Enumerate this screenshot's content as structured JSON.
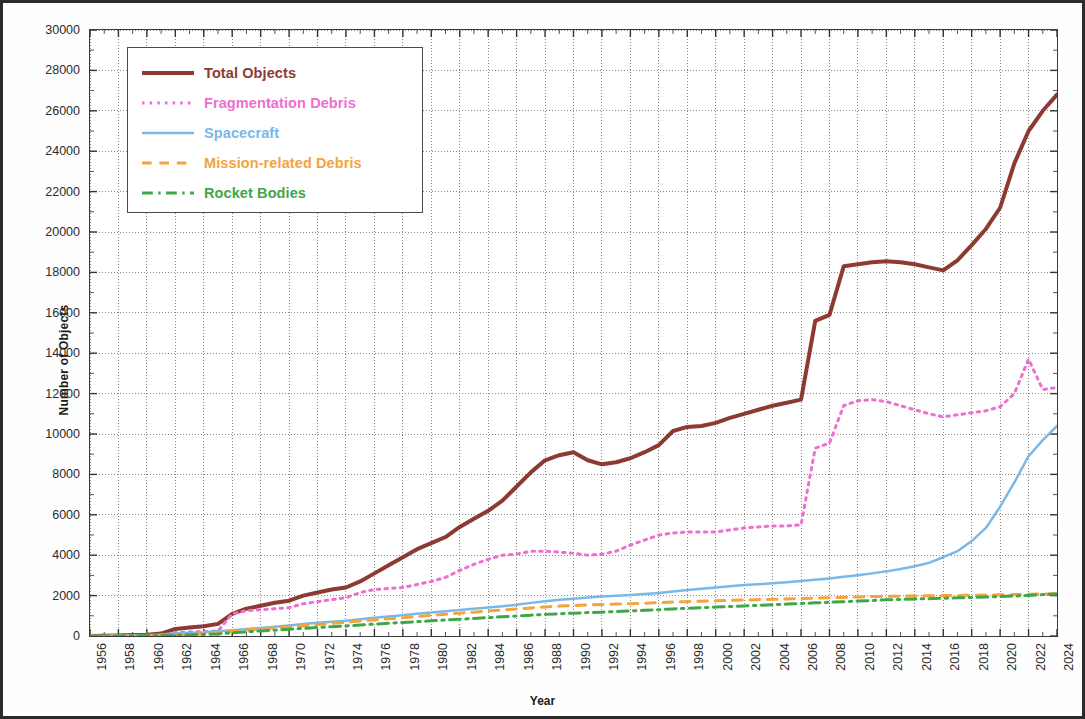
{
  "chart_data": {
    "type": "line",
    "title": "",
    "xlabel": "Year",
    "ylabel": "Number of Objects",
    "xlim": [
      1956,
      2024
    ],
    "ylim": [
      0,
      30000
    ],
    "ytick_step": 2000,
    "xtick_step": 2,
    "grid": true,
    "legend_position": "upper-left",
    "xticks": [
      "1956",
      "1958",
      "1960",
      "1962",
      "1964",
      "1966",
      "1968",
      "1970",
      "1972",
      "1974",
      "1976",
      "1978",
      "1980",
      "1982",
      "1984",
      "1986",
      "1988",
      "1990",
      "1992",
      "1994",
      "1996",
      "1998",
      "2000",
      "2002",
      "2004",
      "2006",
      "2008",
      "2010",
      "2012",
      "2014",
      "2016",
      "2018",
      "2020",
      "2022",
      "2024"
    ],
    "yticks": [
      "0",
      "2000",
      "4000",
      "6000",
      "8000",
      "10000",
      "12000",
      "14000",
      "16000",
      "18000",
      "20000",
      "22000",
      "24000",
      "26000",
      "28000",
      "30000"
    ],
    "x": [
      1956,
      1957,
      1958,
      1959,
      1960,
      1961,
      1962,
      1963,
      1964,
      1965,
      1966,
      1967,
      1968,
      1969,
      1970,
      1971,
      1972,
      1973,
      1974,
      1975,
      1976,
      1977,
      1978,
      1979,
      1980,
      1981,
      1982,
      1983,
      1984,
      1985,
      1986,
      1987,
      1988,
      1989,
      1990,
      1991,
      1992,
      1993,
      1994,
      1995,
      1996,
      1997,
      1998,
      1999,
      2000,
      2001,
      2002,
      2003,
      2004,
      2005,
      2006,
      2007,
      2008,
      2009,
      2010,
      2011,
      2012,
      2013,
      2014,
      2015,
      2016,
      2017,
      2018,
      2019,
      2020,
      2021,
      2022,
      2023,
      2024
    ],
    "series": [
      {
        "name": "Total Objects",
        "color": "#8c3b32",
        "style": "solid",
        "width": 4,
        "values": [
          0,
          10,
          30,
          50,
          60,
          120,
          350,
          420,
          480,
          600,
          1100,
          1350,
          1500,
          1650,
          1750,
          2000,
          2150,
          2300,
          2400,
          2700,
          3100,
          3500,
          3900,
          4300,
          4600,
          4900,
          5400,
          5800,
          6200,
          6700,
          7400,
          8100,
          8700,
          8950,
          9100,
          8700,
          8500,
          8600,
          8800,
          9100,
          9450,
          10150,
          10350,
          10400,
          10550,
          10800,
          11000,
          11200,
          11400,
          11550,
          11700,
          15600,
          15900,
          18300,
          18400,
          18500,
          18550,
          18500,
          18400,
          18250,
          18100,
          18600,
          19350,
          20150,
          21200,
          23400,
          25000,
          26000,
          26800
        ]
      },
      {
        "name": "Fragmentation Debris",
        "color": "#ee6fd0",
        "style": "dotted",
        "width": 3,
        "values": [
          0,
          0,
          0,
          5,
          10,
          20,
          170,
          200,
          220,
          250,
          1100,
          1250,
          1300,
          1350,
          1400,
          1600,
          1700,
          1800,
          1900,
          2150,
          2300,
          2350,
          2400,
          2550,
          2700,
          2900,
          3250,
          3550,
          3800,
          4000,
          4050,
          4200,
          4200,
          4150,
          4100,
          4000,
          4050,
          4200,
          4500,
          4750,
          5000,
          5100,
          5150,
          5150,
          5150,
          5250,
          5350,
          5400,
          5450,
          5450,
          5500,
          9300,
          9550,
          11400,
          11650,
          11700,
          11600,
          11400,
          11200,
          11000,
          10850,
          10950,
          11050,
          11150,
          11350,
          12000,
          13700,
          12200,
          12300
        ]
      },
      {
        "name": "Spacecraft",
        "color": "#79b8e8",
        "style": "solid",
        "width": 2.5,
        "values": [
          0,
          5,
          20,
          35,
          45,
          70,
          120,
          150,
          180,
          230,
          290,
          350,
          400,
          460,
          520,
          590,
          650,
          700,
          760,
          830,
          900,
          960,
          1030,
          1100,
          1160,
          1230,
          1290,
          1350,
          1410,
          1470,
          1550,
          1640,
          1720,
          1790,
          1850,
          1900,
          1950,
          1990,
          2030,
          2080,
          2130,
          2200,
          2280,
          2340,
          2400,
          2460,
          2520,
          2560,
          2610,
          2660,
          2720,
          2780,
          2850,
          2930,
          3010,
          3100,
          3200,
          3320,
          3450,
          3620,
          3900,
          4200,
          4700,
          5350,
          6400,
          7600,
          8900,
          9700,
          10400
        ]
      },
      {
        "name": "Mission-related Debris",
        "color": "#f5a33c",
        "style": "dashed",
        "width": 3,
        "values": [
          0,
          2,
          8,
          15,
          25,
          40,
          60,
          80,
          110,
          150,
          230,
          300,
          350,
          400,
          450,
          510,
          570,
          620,
          680,
          740,
          800,
          850,
          900,
          960,
          1020,
          1080,
          1130,
          1180,
          1240,
          1290,
          1340,
          1390,
          1440,
          1480,
          1510,
          1540,
          1560,
          1580,
          1600,
          1620,
          1650,
          1680,
          1700,
          1720,
          1740,
          1760,
          1780,
          1800,
          1820,
          1830,
          1850,
          1870,
          1890,
          1910,
          1930,
          1950,
          1960,
          1970,
          1980,
          1990,
          2000,
          2010,
          2020,
          2030,
          2040,
          2050,
          2070,
          2080,
          2090
        ]
      },
      {
        "name": "Rocket Bodies",
        "color": "#3fa747",
        "style": "dashdot",
        "width": 3,
        "values": [
          0,
          2,
          6,
          12,
          20,
          30,
          45,
          60,
          80,
          105,
          160,
          210,
          250,
          290,
          330,
          380,
          420,
          460,
          500,
          545,
          590,
          630,
          670,
          710,
          750,
          790,
          830,
          870,
          910,
          950,
          990,
          1030,
          1070,
          1100,
          1130,
          1160,
          1180,
          1210,
          1240,
          1270,
          1300,
          1340,
          1370,
          1400,
          1430,
          1460,
          1490,
          1520,
          1550,
          1580,
          1610,
          1640,
          1670,
          1700,
          1730,
          1760,
          1790,
          1810,
          1830,
          1850,
          1870,
          1890,
          1910,
          1930,
          1950,
          1980,
          2010,
          2050,
          2080
        ]
      }
    ]
  },
  "legend": {
    "items": [
      {
        "label": "Total Objects"
      },
      {
        "label": "Fragmentation Debris"
      },
      {
        "label": "Spacecraft"
      },
      {
        "label": "Mission-related Debris"
      },
      {
        "label": "Rocket Bodies"
      }
    ]
  }
}
